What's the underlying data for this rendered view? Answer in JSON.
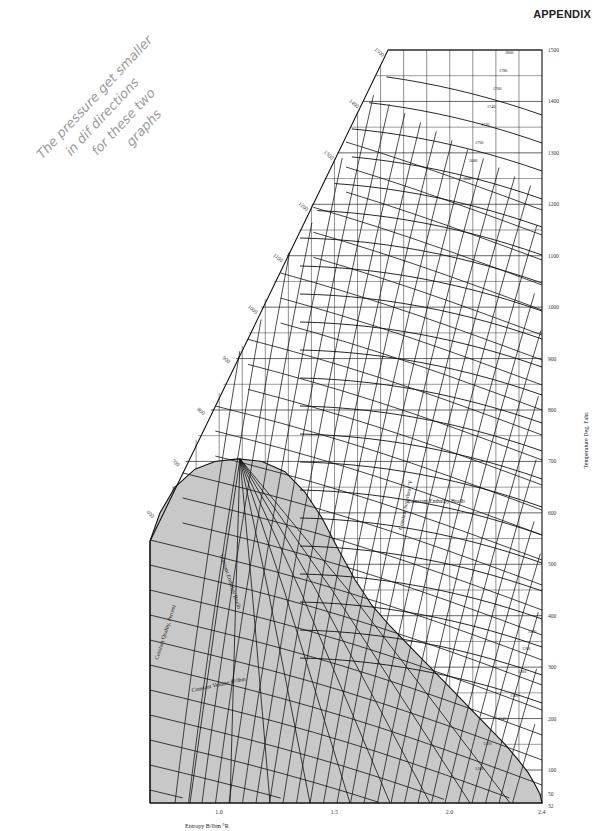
{
  "header": {
    "title": "APPENDIX"
  },
  "annotation": {
    "lines": [
      "The pressure get smaller",
      "in dif directions",
      "for these two",
      "graphs"
    ],
    "color": "#9a9a9a"
  },
  "chart_data": {
    "type": "line",
    "xlabel": "Entropy B/lbm °R",
    "ylabel": "Temperature Deg. Fahr.",
    "xlim": [
      0.7,
      2.4
    ],
    "ylim": [
      32,
      1500
    ],
    "x_ticks": [
      "1.0",
      "1.5",
      "2.0",
      "2.4"
    ],
    "y_ticks": [
      "32",
      "50",
      "100",
      "200",
      "300",
      "400",
      "500",
      "600",
      "700",
      "800",
      "900",
      "1000",
      "1100",
      "1200",
      "1300",
      "1400",
      "1500"
    ],
    "left_edge_ticks": [
      "600",
      "700",
      "800",
      "900",
      "1000",
      "1100",
      "1200",
      "1300",
      "1400",
      "1500"
    ],
    "grid": true,
    "regions": {
      "two_phase_dome_fill": "#c8c8c8",
      "critical_point_approx": {
        "s": 1.06,
        "T": 705
      }
    },
    "line_families": [
      {
        "name": "Constant Quality, Percent",
        "labels": [
          "10",
          "20",
          "30",
          "40",
          "50",
          "60",
          "70",
          "80",
          "90"
        ]
      },
      {
        "name": "Constant Enthalpy Btu/lb",
        "labels": [
          "1100",
          "1120",
          "1140",
          "1160",
          "1180",
          "1200",
          "1220",
          "1240",
          "1260",
          "1280",
          "1300",
          "1320",
          "1340",
          "1360",
          "1380",
          "1400",
          "1420",
          "1440",
          "1460",
          "1480",
          "1500",
          "1520",
          "1540",
          "1560",
          "1580",
          "1600",
          "1620",
          "1640",
          "1660",
          "1680",
          "1700",
          "1720",
          "1740",
          "1760",
          "1780",
          "1800"
        ]
      },
      {
        "name": "Constant Volume ft³/lbm",
        "labels": [
          "0.1",
          "0.5",
          "1",
          "2",
          "5",
          "10",
          "20",
          "50",
          "100",
          "200",
          "500",
          "1000",
          "2000"
        ]
      },
      {
        "name": "Constant Pressure psia",
        "labels": [
          "0.5",
          "1",
          "2",
          "5",
          "10",
          "20",
          "50",
          "100",
          "200",
          "500",
          "1000",
          "2000",
          "3000",
          "4000",
          "5000",
          "10000",
          "15000",
          "20000"
        ]
      },
      {
        "name": "Constant Superheat °F",
        "labels": [
          "50",
          "100",
          "200",
          "300",
          "400",
          "500",
          "600",
          "700",
          "800"
        ]
      }
    ],
    "right_edge_enthalpy_labels": [
      "1100",
      "1120",
      "1140",
      "1160",
      "1180",
      "1200",
      "1220"
    ],
    "inline_labels": {
      "constant_enthalpy": "Constant Enthalpy Btu/lb",
      "constant_volume": "Constant Volume ft³/lbm",
      "constant_quality": "Constant Quality, Percent",
      "constant_superheat": "Constant Superheat °F"
    }
  }
}
